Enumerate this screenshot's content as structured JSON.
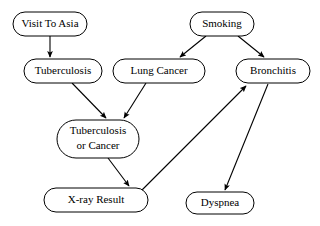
{
  "diagram": {
    "type": "directed-acyclic-graph",
    "background_color": "#ffffff",
    "node_fill_color": "#ffffff",
    "node_stroke_color": "#000000",
    "edge_color": "#000000",
    "nodes": [
      {
        "id": "visit_to_asia",
        "label": "Visit To Asia",
        "x": 50,
        "y": 24,
        "w": 74,
        "h": 24,
        "font_size": 11,
        "lines": [
          "Visit To Asia"
        ]
      },
      {
        "id": "smoking",
        "label": "Smoking",
        "x": 222,
        "y": 24,
        "w": 64,
        "h": 24,
        "font_size": 11,
        "lines": [
          "Smoking"
        ]
      },
      {
        "id": "tuberculosis",
        "label": "Tuberculosis",
        "x": 63,
        "y": 71,
        "w": 78,
        "h": 24,
        "font_size": 11,
        "lines": [
          "Tuberculosis"
        ]
      },
      {
        "id": "lung_cancer",
        "label": "Lung Cancer",
        "x": 159,
        "y": 71,
        "w": 92,
        "h": 24,
        "font_size": 11,
        "lines": [
          "Lung Cancer"
        ]
      },
      {
        "id": "bronchitis",
        "label": "Bronchitis",
        "x": 273,
        "y": 71,
        "w": 74,
        "h": 24,
        "font_size": 11,
        "lines": [
          "Bronchitis"
        ]
      },
      {
        "id": "tuberculosis_or_cancer",
        "label": "Tuberculosis or Cancer",
        "x": 98,
        "y": 139,
        "w": 82,
        "h": 38,
        "font_size": 11,
        "lines": [
          "Tuberculosis",
          "or Cancer"
        ]
      },
      {
        "id": "xray_result",
        "label": "X-ray Result",
        "x": 96,
        "y": 200,
        "w": 104,
        "h": 24,
        "font_size": 11,
        "lines": [
          "X-ray Result"
        ]
      },
      {
        "id": "dyspnea",
        "label": "Dyspnea",
        "x": 220,
        "y": 203,
        "w": 68,
        "h": 22,
        "font_size": 11,
        "lines": [
          "Dyspnea"
        ]
      }
    ],
    "edges": [
      {
        "id": "e1",
        "from": "visit_to_asia",
        "to": "tuberculosis",
        "points": "50,36 50,57",
        "arrow": "50,59"
      },
      {
        "id": "e2",
        "from": "smoking",
        "to": "lung_cancer",
        "points": "206,36 180,57",
        "arrow": "178,59"
      },
      {
        "id": "e3",
        "from": "smoking",
        "to": "bronchitis",
        "points": "238,36 264,57",
        "arrow": "266,59"
      },
      {
        "id": "e4",
        "from": "tuberculosis",
        "to": "tuberculosis_or_cancer",
        "points": "72,83 106,118",
        "arrow": "108,120"
      },
      {
        "id": "e5",
        "from": "lung_cancer",
        "to": "tuberculosis_or_cancer",
        "points": "146,83 124,118",
        "arrow": "122,120"
      },
      {
        "id": "e6",
        "from": "tuberculosis_or_cancer",
        "to": "xray_result",
        "points": "108,158 129,186",
        "arrow": "131,188"
      },
      {
        "id": "e7",
        "from": "tuberculosis_or_cancer",
        "to": "bronchitis",
        "points": "142,190 246,86",
        "arrow": "248,84"
      },
      {
        "id": "e8",
        "from": "bronchitis",
        "to": "dyspnea",
        "points": "268,84 225,190",
        "arrow": "224,192"
      }
    ]
  }
}
